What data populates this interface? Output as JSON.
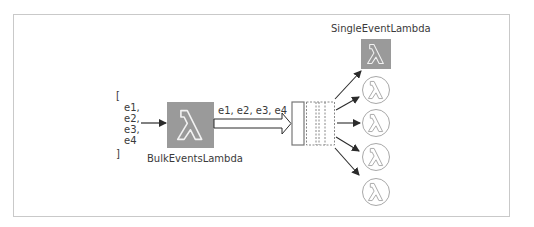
{
  "diagram": {
    "input_list": {
      "open_bracket": "[",
      "items": [
        "e1,",
        "e2,",
        "e3,",
        "e4"
      ],
      "close_bracket": "]"
    },
    "bulk_lambda": {
      "label": "BulkEventsLambda",
      "icon": "lambda-icon",
      "fill": "#9a9a9a"
    },
    "batch_arrow": {
      "label": "e1, e2, e3, e4"
    },
    "queue": {
      "icon": "queue-icon",
      "slots": 4
    },
    "single_lambda": {
      "label": "SingleEventLambda",
      "active_instances": 1,
      "idle_instances": 4,
      "fill": "#9a9a9a",
      "outline": "#a8a8a8"
    },
    "colors": {
      "border": "#c9c9c9",
      "arrow": "#2b2b2b",
      "text": "#3a3a3a"
    }
  }
}
